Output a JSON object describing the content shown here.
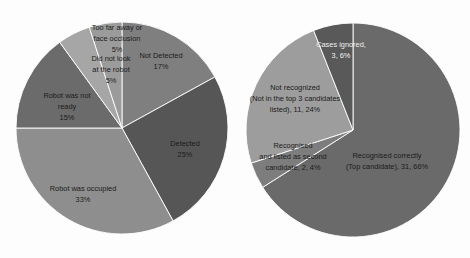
{
  "figure": {
    "background_color": "#fdfdfd",
    "label_color": "#1b1b1b",
    "panels": [
      "left-pie-chart",
      "right-pie-chart"
    ]
  },
  "chart_data": [
    {
      "type": "pie",
      "id": "detection-outcomes",
      "title": "",
      "legend": "none",
      "labels_inside": true,
      "start_angle_deg": 0,
      "direction": "clockwise",
      "categories": [
        "Not Detected",
        "Detected",
        "Robot was occupied",
        "Robot was not ready",
        "Did not look at the robot",
        "Too far away or face occlusion"
      ],
      "values": [
        17,
        25,
        33,
        15,
        5,
        5
      ],
      "value_unit": "%",
      "colors": [
        "#7f7f7f",
        "#565656",
        "#8e8e8e",
        "#6b6b6b",
        "#a6a6a6",
        "#9b9b9b"
      ],
      "slices": [
        {
          "label": "Not Detected",
          "percent": "17%",
          "value": 17,
          "color": "#7f7f7f",
          "label_lines": [
            "Not Detected",
            "17%"
          ]
        },
        {
          "label": "Detected",
          "percent": "25%",
          "value": 25,
          "color": "#565656",
          "label_lines": [
            "Detected",
            "25%"
          ]
        },
        {
          "label": "Robot was occupied",
          "percent": "33%",
          "value": 33,
          "color": "#8e8e8e",
          "label_lines": [
            "Robot was occupied",
            "33%"
          ]
        },
        {
          "label": "Robot was not ready",
          "percent": "15%",
          "value": 15,
          "color": "#6b6b6b",
          "label_lines": [
            "Robot was not",
            "ready",
            "15%"
          ]
        },
        {
          "label": "Did not look at the robot",
          "percent": "5%",
          "value": 5,
          "color": "#a6a6a6",
          "label_lines": [
            "Did not look",
            "at the robot",
            "5%"
          ]
        },
        {
          "label": "Too far away or face occlusion",
          "percent": "5%",
          "value": 5,
          "color": "#9b9b9b",
          "label_lines": [
            "Too far away or",
            "face occlusion",
            "5%"
          ]
        }
      ]
    },
    {
      "type": "pie",
      "id": "recognition-outcomes",
      "title": "",
      "legend": "none",
      "labels_inside": true,
      "start_angle_deg": 0,
      "direction": "clockwise",
      "categories": [
        "Recognised correctly (Top candidate)",
        "Recognised and listed as second candidate",
        "Not recognized (Not in the top 3 candidates listed)",
        "Cases ignored"
      ],
      "values": [
        66,
        4,
        24,
        6
      ],
      "counts": [
        31,
        2,
        11,
        3
      ],
      "value_unit": "%",
      "colors": [
        "#6a6a6a",
        "#7d7d7d",
        "#9d9d9d",
        "#595959"
      ],
      "slices": [
        {
          "label": "Recognised correctly (Top candidate)",
          "count": 31,
          "percent": "66%",
          "value": 66,
          "color": "#6a6a6a",
          "label_lines": [
            "Recognised correctly",
            "(Top candidate), 31, 66%"
          ]
        },
        {
          "label": "Recognised and listed as second candidate",
          "count": 2,
          "percent": "4%",
          "value": 4,
          "color": "#7d7d7d",
          "label_lines": [
            "Recognised",
            "and listed as second",
            "candidate, 2, 4%"
          ]
        },
        {
          "label": "Not recognized (Not in the top 3 candidates listed)",
          "count": 11,
          "percent": "24%",
          "value": 24,
          "color": "#9d9d9d",
          "label_lines": [
            "Not recognized",
            "(Not in the top 3 candidates",
            "listed), 11, 24%"
          ]
        },
        {
          "label": "Cases ignored",
          "count": 3,
          "percent": "6%",
          "value": 6,
          "color": "#595959",
          "label_lines": [
            "Cases ignored,",
            "3, 6%"
          ]
        }
      ]
    }
  ]
}
